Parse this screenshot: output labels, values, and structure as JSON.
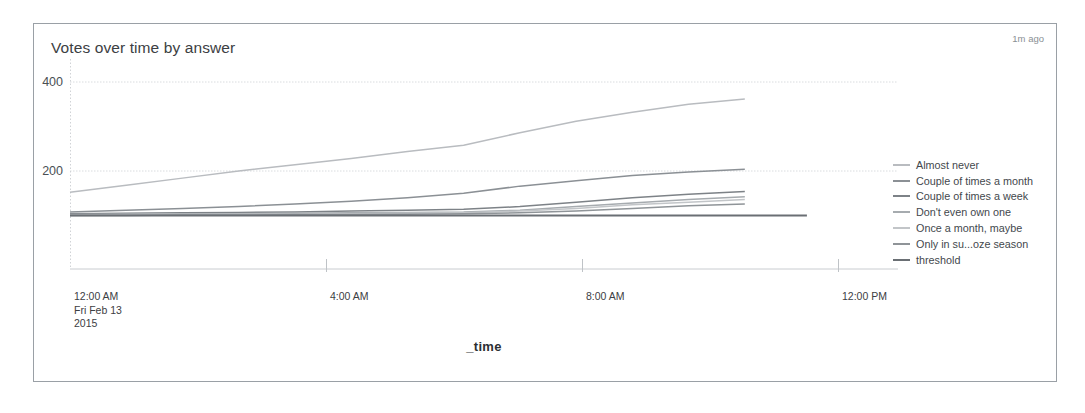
{
  "panel": {
    "title": "Votes over time by answer",
    "timestamp": "1m ago"
  },
  "axes": {
    "xlabel": "_time",
    "y_ticks": [
      "400",
      "200"
    ],
    "x_ticks": [
      {
        "time": "12:00 AM",
        "date": "Fri Feb 13",
        "year": "2015"
      },
      {
        "time": "4:00 AM",
        "date": "",
        "year": ""
      },
      {
        "time": "8:00 AM",
        "date": "",
        "year": ""
      },
      {
        "time": "12:00 PM",
        "date": "",
        "year": ""
      }
    ]
  },
  "legend": {
    "items": [
      {
        "label": "Almost never",
        "color": "#b9bcc0"
      },
      {
        "label": "Couple of times a month",
        "color": "#8b9095"
      },
      {
        "label": "Couple of times a week",
        "color": "#7d8287"
      },
      {
        "label": "Don't even own one",
        "color": "#a6abaf"
      },
      {
        "label": "Once a month, maybe",
        "color": "#c2c5c8"
      },
      {
        "label": "Only in su...oze season",
        "color": "#8f9498"
      },
      {
        "label": "threshold",
        "color": "#6a6f74"
      }
    ]
  },
  "chart_data": {
    "type": "line",
    "title": "Votes over time by answer",
    "xlabel": "_time",
    "ylabel": "",
    "ylim": [
      0,
      450
    ],
    "grid": true,
    "legend_position": "right",
    "x": [
      "12:00 AM",
      "1:00 AM",
      "2:00 AM",
      "3:00 AM",
      "4:00 AM",
      "5:00 AM",
      "6:00 AM",
      "7:00 AM",
      "8:00 AM",
      "9:00 AM",
      "10:00 AM",
      "11:00 AM",
      "12:00 PM"
    ],
    "x_start": "Fri Feb 13 2015 12:00 AM",
    "x_end": "Fri Feb 13 2015 12:00 PM",
    "series": [
      {
        "name": "Almost never",
        "color": "#b9bcc0",
        "values": [
          152,
          168,
          184,
          200,
          214,
          228,
          244,
          258,
          286,
          312,
          332,
          350,
          362
        ]
      },
      {
        "name": "Couple of times a month",
        "color": "#8b9095",
        "values": [
          108,
          112,
          116,
          120,
          126,
          132,
          140,
          150,
          166,
          178,
          190,
          198,
          204
        ]
      },
      {
        "name": "Couple of times a week",
        "color": "#7d8287",
        "values": [
          104,
          105,
          106,
          107,
          108,
          110,
          112,
          114,
          120,
          130,
          140,
          148,
          154
        ]
      },
      {
        "name": "Don't even own one",
        "color": "#a6abaf",
        "values": [
          102,
          103,
          104,
          104,
          105,
          106,
          107,
          108,
          112,
          120,
          128,
          136,
          142
        ]
      },
      {
        "name": "Once a month, maybe",
        "color": "#c2c5c8",
        "values": [
          101,
          102,
          102,
          103,
          103,
          104,
          105,
          106,
          110,
          116,
          124,
          130,
          136
        ]
      },
      {
        "name": "Only in su...oze season",
        "color": "#8f9498",
        "values": [
          100,
          100,
          101,
          101,
          102,
          102,
          103,
          104,
          106,
          110,
          116,
          122,
          126
        ]
      },
      {
        "name": "threshold",
        "color": "#6a6f74",
        "values": [
          100,
          100,
          100,
          100,
          100,
          100,
          100,
          100,
          100,
          100,
          100,
          100,
          100
        ],
        "extends_past_data": true
      }
    ]
  }
}
